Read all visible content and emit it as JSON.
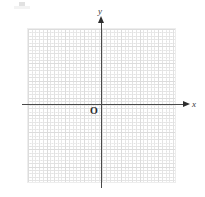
{
  "figure": {
    "background_color": "#ffffff"
  },
  "artifact": {
    "name": "scan-artifact",
    "description": "faint gray scanning smudge in the upper-left corner"
  },
  "axes": {
    "x": {
      "label": "x",
      "color": "#4a4a4a",
      "arrow": "right-arrowhead"
    },
    "y": {
      "label": "y",
      "color": "#4a4a4a",
      "arrow": "up-arrowhead"
    },
    "origin": {
      "label": "O"
    }
  },
  "grid": {
    "major_color": "#dcdcdc",
    "minor_color": "#c9c9c9",
    "border_color": "#ededed",
    "major_columns": 8,
    "major_rows": 9,
    "minor_per_major": 5
  },
  "chart_data": {
    "type": "scatter",
    "title": "",
    "subtitle": "",
    "xlabel": "x",
    "ylabel": "y",
    "xlim": [
      -4,
      4
    ],
    "ylim": [
      -5,
      4
    ],
    "xticks": [
      -4,
      -3,
      -2,
      -1,
      0,
      1,
      2,
      3,
      4
    ],
    "yticks": [
      -5,
      -4,
      -3,
      -2,
      -1,
      0,
      1,
      2,
      3,
      4
    ],
    "xtick_labels": [
      "",
      "",
      "",
      "",
      "",
      "",
      "",
      "",
      ""
    ],
    "ytick_labels": [
      "",
      "",
      "",
      "",
      "",
      "",
      "",
      "",
      "",
      ""
    ],
    "grid": true,
    "minor_grid": true,
    "legend": null,
    "legend_position": "none",
    "series": [],
    "x": [],
    "values": [],
    "annotations": [
      {
        "text": "O",
        "x": 0,
        "y": 0,
        "note": "origin label, placed lower-left of origin"
      },
      {
        "text": "x",
        "x": 4,
        "y": 0,
        "note": "x-axis name at arrow tip"
      },
      {
        "text": "y",
        "x": 0,
        "y": 4,
        "note": "y-axis name above arrow tip"
      }
    ]
  }
}
